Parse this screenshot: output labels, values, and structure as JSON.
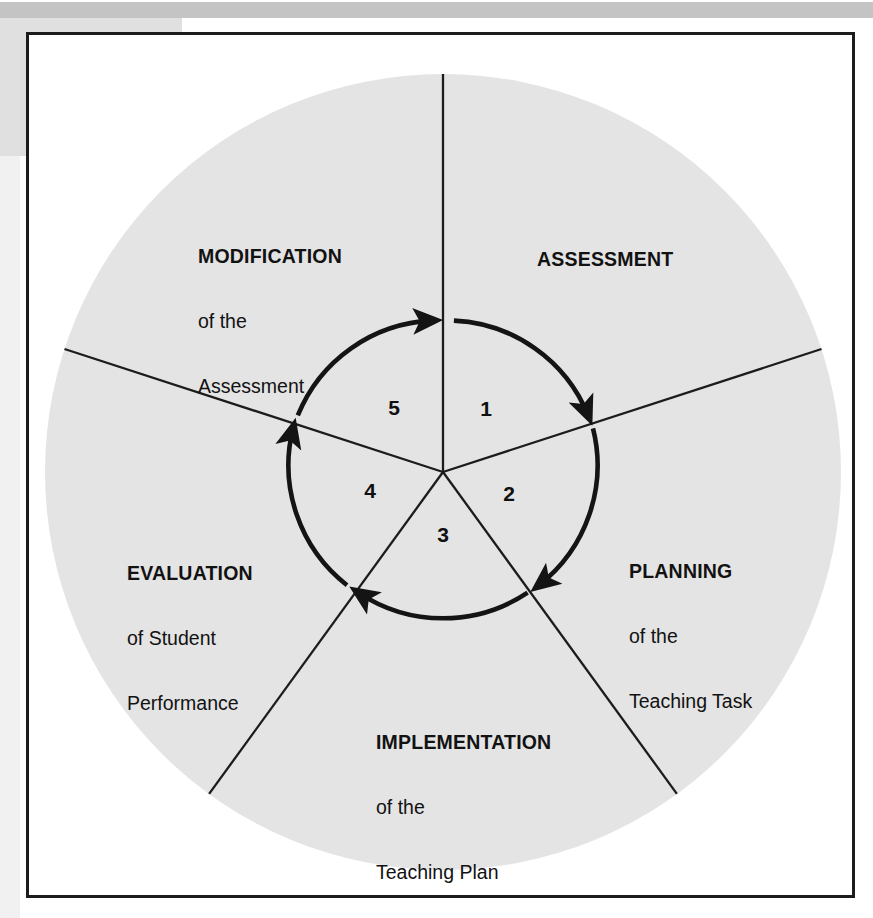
{
  "figure": {
    "type": "cyclic-process-diagram",
    "shape": "circle divided into five sectors",
    "center": {
      "x": 443,
      "y": 472
    },
    "radius": 398,
    "fill_color": "#e4e4e4",
    "line_color": "#1c1c1c",
    "frame_color": "#1c1c1c",
    "background_color": "#ffffff",
    "arrow_direction": "clockwise",
    "inner_arrow_radius": 152,
    "sectors": [
      {
        "step": "1",
        "title": "ASSESSMENT",
        "line2": "",
        "line3": "",
        "start_angle_deg": 0,
        "end_angle_deg": 72
      },
      {
        "step": "2",
        "title": "PLANNING",
        "line2": "of the",
        "line3": "Teaching Task",
        "start_angle_deg": 72,
        "end_angle_deg": 144
      },
      {
        "step": "3",
        "title": "IMPLEMENTATION",
        "line2": "of the",
        "line3": "Teaching Plan",
        "start_angle_deg": 144,
        "end_angle_deg": 216
      },
      {
        "step": "4",
        "title": "EVALUATION",
        "line2": "of Student",
        "line3": "Performance",
        "start_angle_deg": 216,
        "end_angle_deg": 288
      },
      {
        "step": "5",
        "title": "MODIFICATION",
        "line2": "of the",
        "line3": "Assessment",
        "start_angle_deg": 288,
        "end_angle_deg": 360
      }
    ],
    "numbers": [
      "1",
      "2",
      "3",
      "4",
      "5"
    ],
    "arrows": [
      {
        "name": "arrow-1-to-2",
        "from_step": "1",
        "to_step": "2"
      },
      {
        "name": "arrow-2-to-3",
        "from_step": "2",
        "to_step": "3"
      },
      {
        "name": "arrow-3-to-4",
        "from_step": "3",
        "to_step": "4"
      },
      {
        "name": "arrow-4-to-5",
        "from_step": "4",
        "to_step": "5"
      },
      {
        "name": "arrow-5-to-1",
        "from_step": "5",
        "to_step": "1"
      }
    ]
  }
}
